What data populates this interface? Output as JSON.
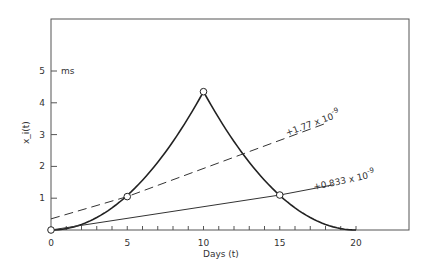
{
  "chart_data": {
    "type": "line",
    "title": "",
    "xlabel": "Days (t)",
    "ylabel": "x_i(t)",
    "y_unit": "ms",
    "xlim": [
      0,
      23
    ],
    "ylim": [
      0,
      6.3
    ],
    "x_ticks": [
      0,
      5,
      10,
      15,
      20
    ],
    "x_tick_labels": [
      "0",
      "5",
      "10",
      "15",
      "20"
    ],
    "y_ticks": [
      1,
      2,
      3,
      4,
      5
    ],
    "y_tick_labels": [
      "1",
      "2",
      "3",
      "4",
      "5"
    ],
    "grid": false,
    "series": [
      {
        "name": "x_i(t) curve",
        "style": "solid-thick",
        "x": [
          0,
          2,
          4,
          5,
          6,
          8,
          10,
          12,
          14,
          15,
          16,
          18,
          20
        ],
        "y": [
          0,
          0.17,
          0.7,
          1.1,
          1.58,
          2.8,
          4.35,
          2.78,
          1.56,
          1.1,
          0.7,
          0.17,
          0
        ]
      },
      {
        "name": "+1.77 x 10^-9",
        "style": "dashed",
        "x": [
          0,
          5,
          18
        ],
        "y": [
          0.35,
          1.05,
          3.35
        ]
      },
      {
        "name": "+0.833 x 10^-9",
        "style": "solid-thin",
        "x": [
          0,
          15,
          18.5
        ],
        "y": [
          0,
          1.1,
          1.42
        ]
      }
    ],
    "markers": [
      {
        "x": 0,
        "y": 0
      },
      {
        "x": 5,
        "y": 1.05
      },
      {
        "x": 10,
        "y": 4.35
      },
      {
        "x": 15,
        "y": 1.1
      }
    ],
    "annotations": [
      {
        "text": "+1.77 x 10",
        "sup": "-9",
        "near_series": "dashed"
      },
      {
        "text": "+0.833 x 10",
        "sup": "-9",
        "near_series": "solid-thin"
      }
    ]
  }
}
